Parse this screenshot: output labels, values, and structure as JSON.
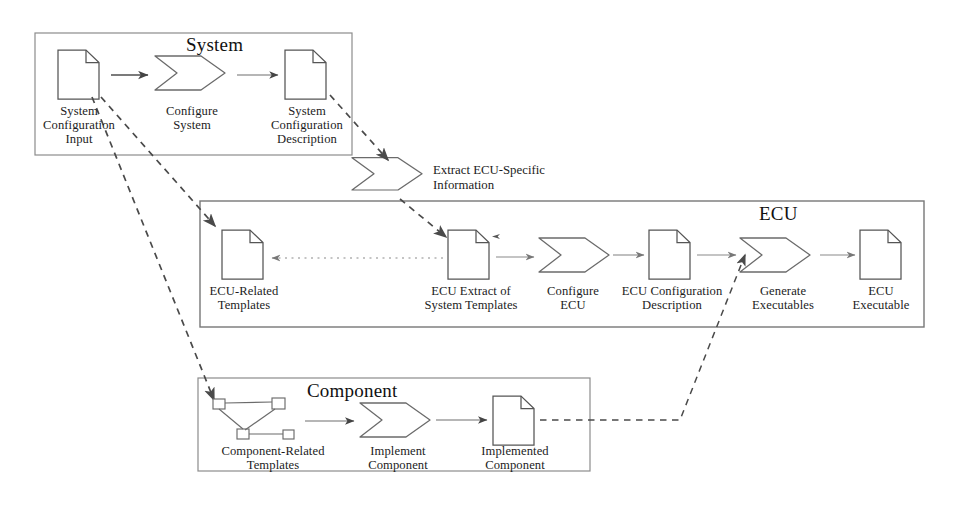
{
  "diagram": {
    "background_color": "#ffffff",
    "stroke_color": "#4a4a4a",
    "text_color": "#1c1c1c"
  },
  "lanes": [
    {
      "id": "system",
      "title": "System",
      "x": 35,
      "y": 33,
      "w": 317,
      "h": 122
    },
    {
      "id": "ecu",
      "title": "ECU",
      "x": 200,
      "y": 201,
      "w": 724,
      "h": 126
    },
    {
      "id": "component",
      "title": "Component",
      "x": 198,
      "y": 378,
      "w": 392,
      "h": 93
    }
  ],
  "lane_titles": [
    {
      "lane": "system",
      "label": "System",
      "x": 186,
      "y": 38
    },
    {
      "lane": "ecu",
      "label": "ECU",
      "x": 759,
      "y": 206
    },
    {
      "lane": "component",
      "label": "Component",
      "x": 307,
      "y": 383
    }
  ],
  "nodes": [
    {
      "id": "sys-config-input",
      "type": "document",
      "lane": "system",
      "icon": "document-icon",
      "x": 58,
      "y": 50,
      "w": 42,
      "h": 50,
      "label": "System\nConfiguration\nInput",
      "label_x": 19,
      "label_y": 104,
      "label_w": 120
    },
    {
      "id": "configure-system",
      "type": "process",
      "lane": "system",
      "icon": "chevron-process-icon",
      "x": 155,
      "y": 58,
      "w": 73,
      "h": 40,
      "label": "Configure\nSystem",
      "label_x": 136,
      "label_y": 104,
      "label_w": 112
    },
    {
      "id": "sys-config-desc",
      "type": "document",
      "lane": "system",
      "icon": "document-icon",
      "x": 285,
      "y": 50,
      "w": 42,
      "h": 50,
      "label": "System\nConfiguration\nDescription",
      "label_x": 246,
      "label_y": 104,
      "label_w": 122
    },
    {
      "id": "extract-ecu-specific",
      "type": "process",
      "lane": null,
      "icon": "chevron-process-icon",
      "x": 352,
      "y": 167,
      "w": 73,
      "h": 32,
      "label": "Extract ECU-Specific\nInformation",
      "label_x": 433,
      "label_y": 165,
      "label_w": 200
    },
    {
      "id": "ecu-related-templates",
      "type": "document",
      "lane": "ecu",
      "icon": "document-icon",
      "x": 222,
      "y": 230,
      "w": 42,
      "h": 50,
      "label": "ECU-Related\nTemplates",
      "label_x": 183,
      "label_y": 284,
      "label_w": 122
    },
    {
      "id": "ecu-extract-system-templates",
      "type": "document",
      "lane": "ecu",
      "icon": "document-icon",
      "x": 448,
      "y": 230,
      "w": 42,
      "h": 50,
      "label": "ECU Extract of\nSystem Templates",
      "label_x": 400,
      "label_y": 284,
      "label_w": 142
    },
    {
      "id": "configure-ecu",
      "type": "process",
      "lane": "ecu",
      "icon": "chevron-process-icon",
      "x": 539,
      "y": 239,
      "w": 66,
      "h": 34,
      "label": "Configure\nECU",
      "label_x": 535,
      "label_y": 284,
      "label_w": 76
    },
    {
      "id": "ecu-config-description",
      "type": "document",
      "lane": "ecu",
      "icon": "document-icon",
      "x": 649,
      "y": 230,
      "w": 42,
      "h": 50,
      "label": "ECU Configuration\nDescription",
      "label_x": 602,
      "label_y": 284,
      "label_w": 140
    },
    {
      "id": "generate-executables",
      "type": "process",
      "lane": "ecu",
      "icon": "chevron-process-icon",
      "x": 740,
      "y": 239,
      "w": 72,
      "h": 34,
      "label": "Generate\nExecutables",
      "label_x": 735,
      "label_y": 284,
      "label_w": 96
    },
    {
      "id": "ecu-executable",
      "type": "document",
      "lane": "ecu",
      "icon": "document-icon",
      "x": 860,
      "y": 230,
      "w": 42,
      "h": 50,
      "label": "ECU\nExecutable",
      "label_x": 823,
      "label_y": 284,
      "label_w": 116
    },
    {
      "id": "component-related-templates",
      "type": "network",
      "lane": "component",
      "icon": "network-graph-icon",
      "x": 210,
      "y": 397,
      "w": 82,
      "h": 46,
      "label": "Component-Related\nTemplates",
      "label_x": 199,
      "label_y": 444,
      "label_w": 148
    },
    {
      "id": "implement-component",
      "type": "process",
      "lane": "component",
      "icon": "chevron-process-icon",
      "x": 360,
      "y": 404,
      "w": 70,
      "h": 34,
      "label": "Implement\nComponent",
      "label_x": 350,
      "label_y": 444,
      "label_w": 96
    },
    {
      "id": "implemented-component",
      "type": "document",
      "lane": "component",
      "icon": "document-icon",
      "x": 493,
      "y": 396,
      "w": 42,
      "h": 50,
      "label": "Implemented\nComponent",
      "label_x": 455,
      "label_y": 444,
      "label_w": 120
    }
  ],
  "edges": [
    {
      "id": "e1",
      "from": "sys-config-input",
      "to": "configure-system",
      "style": "solid",
      "label": ""
    },
    {
      "id": "e2",
      "from": "configure-system",
      "to": "sys-config-desc",
      "style": "solid",
      "label": ""
    },
    {
      "id": "e3",
      "from": "sys-config-desc",
      "to": "extract-ecu-specific",
      "style": "dashed",
      "label": ""
    },
    {
      "id": "e4",
      "from": "sys-config-input",
      "to": "ecu-related-templates",
      "style": "dashed",
      "label": ""
    },
    {
      "id": "e5",
      "from": "sys-config-input",
      "to": "component-related-templates",
      "style": "dashed",
      "label": ""
    },
    {
      "id": "e6",
      "from": "extract-ecu-specific",
      "to": "ecu-extract-system-templates",
      "style": "dashed",
      "label": ""
    },
    {
      "id": "e7",
      "from": "ecu-extract-system-templates",
      "to": "ecu-related-templates",
      "style": "dotted",
      "label": ""
    },
    {
      "id": "e8",
      "from": "ecu-extract-system-templates",
      "to": "configure-ecu",
      "style": "solid",
      "label": ""
    },
    {
      "id": "e9",
      "from": "configure-ecu",
      "to": "ecu-config-description",
      "style": "solid",
      "label": ""
    },
    {
      "id": "e10",
      "from": "ecu-config-description",
      "to": "generate-executables",
      "style": "solid",
      "label": ""
    },
    {
      "id": "e11",
      "from": "generate-executables",
      "to": "ecu-executable",
      "style": "solid",
      "label": ""
    },
    {
      "id": "e12",
      "from": "component-related-templates",
      "to": "implement-component",
      "style": "solid",
      "label": ""
    },
    {
      "id": "e13",
      "from": "implement-component",
      "to": "implemented-component",
      "style": "solid",
      "label": ""
    },
    {
      "id": "e14",
      "from": "implemented-component",
      "to": "generate-executables",
      "style": "dashed",
      "label": ""
    }
  ]
}
